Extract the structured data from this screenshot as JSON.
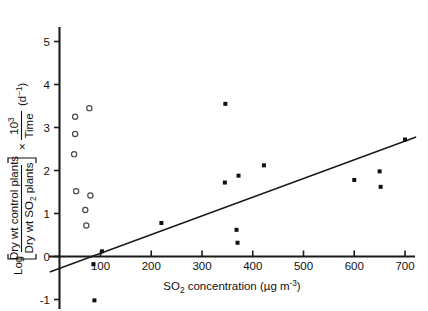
{
  "chart_data": {
    "type": "scatter",
    "title": "",
    "xlabel": "SO2 concentration (µg m-3)",
    "xlabel_parts": {
      "prefix": "SO",
      "sub": "2",
      "mid": " concentration (µg m",
      "sup": "-3",
      "suffix": ")"
    },
    "ylabel": "Log [Dry wt control plants / Dry wt SO2 plants] x 10^3/Time (d-1)",
    "ylabel_parts": {
      "log": "Log",
      "numerator": "Dry wt control plants",
      "denominator_pre": "Dry wt SO",
      "denominator_sub": "2",
      "denominator_post": " plants",
      "times": "×",
      "frac_top": "10",
      "frac_top_sup": "3",
      "frac_bottom": "Time",
      "units_pre": "(d",
      "units_sup": "−1",
      "units_post": ")"
    },
    "xlim": [
      0,
      730
    ],
    "ylim": [
      -1.35,
      5.45
    ],
    "xticks": [
      100,
      200,
      300,
      400,
      500,
      600,
      700
    ],
    "xticklabels": [
      "100",
      "200",
      "300",
      "400",
      "500",
      "600",
      "700"
    ],
    "yticks": [
      -1,
      0,
      1,
      2,
      3,
      4,
      5
    ],
    "yticklabels": [
      "-1",
      "0",
      "1",
      "2",
      "3",
      "4",
      "5"
    ],
    "grid": false,
    "legend": "none",
    "series": [
      {
        "name": "open-circles",
        "marker": "open-circle",
        "points": [
          {
            "x": 50,
            "y": 3.25
          },
          {
            "x": 78,
            "y": 3.45
          },
          {
            "x": 50,
            "y": 2.85
          },
          {
            "x": 48,
            "y": 2.38
          },
          {
            "x": 52,
            "y": 1.52
          },
          {
            "x": 80,
            "y": 1.42
          },
          {
            "x": 70,
            "y": 1.08
          },
          {
            "x": 72,
            "y": 0.72
          }
        ]
      },
      {
        "name": "filled-points",
        "marker": "filled-square",
        "points": [
          {
            "x": 86,
            "y": -0.18
          },
          {
            "x": 88,
            "y": -1.02
          },
          {
            "x": 103,
            "y": 0.12
          },
          {
            "x": 220,
            "y": 0.78
          },
          {
            "x": 346,
            "y": 3.55
          },
          {
            "x": 345,
            "y": 1.72
          },
          {
            "x": 372,
            "y": 1.88
          },
          {
            "x": 368,
            "y": 0.62
          },
          {
            "x": 370,
            "y": 0.32
          },
          {
            "x": 422,
            "y": 2.12
          },
          {
            "x": 600,
            "y": 1.78
          },
          {
            "x": 650,
            "y": 1.98
          },
          {
            "x": 652,
            "y": 1.62
          },
          {
            "x": 700,
            "y": 2.72
          }
        ]
      }
    ],
    "trendline": {
      "name": "regression-line",
      "x_start": 0,
      "y_start": -0.36,
      "x_end": 722,
      "y_end": 2.78
    }
  }
}
